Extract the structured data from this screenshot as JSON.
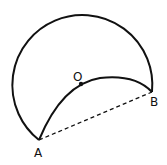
{
  "diagram": {
    "points": {
      "A": {
        "label": "A",
        "x": 39,
        "y": 140
      },
      "B": {
        "label": "B",
        "x": 152,
        "y": 92
      },
      "O": {
        "label": "O",
        "x": 81,
        "y": 84
      }
    },
    "segments": [
      {
        "from": "A",
        "to": "B",
        "style": "dashed"
      }
    ],
    "arcs": [
      {
        "name": "outer-arc",
        "from": "A",
        "to": "B",
        "style": "solid"
      },
      {
        "name": "inner-arc",
        "from": "A",
        "to": "B",
        "through": "O",
        "style": "solid"
      }
    ],
    "colors": {
      "stroke": "#111111",
      "background": "#ffffff"
    }
  }
}
